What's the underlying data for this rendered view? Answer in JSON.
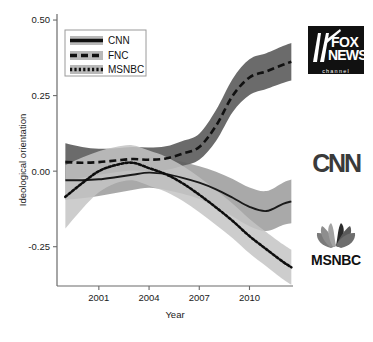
{
  "chart_data": {
    "type": "line",
    "title": "",
    "xlabel": "Year",
    "ylabel": "Ideological orientation",
    "xlim": [
      1998.5,
      2012.6
    ],
    "ylim": [
      -0.38,
      0.52
    ],
    "xticks": [
      2001,
      2004,
      2007,
      2010
    ],
    "xtick_labels": [
      "2001",
      "2004",
      "2007",
      "2010"
    ],
    "yticks": [
      0.5,
      0.25,
      0.0,
      -0.25
    ],
    "ytick_labels": [
      "0.50",
      "0.25",
      "0.00",
      "-0.25"
    ],
    "grid": false,
    "legend_position": "top-left",
    "band_type": "confidence interval",
    "series": [
      {
        "name": "CNN",
        "style": "solid",
        "color": "#1a1a1a",
        "band_color": "#9a9a9a",
        "x": [
          1999.0,
          2000.0,
          2001.0,
          2002.0,
          2003.0,
          2004.0,
          2005.0,
          2006.0,
          2007.0,
          2008.0,
          2009.0,
          2010.0,
          2011.0,
          2012.0,
          2012.5
        ],
        "values": [
          -0.03,
          -0.03,
          -0.027,
          -0.02,
          -0.012,
          -0.005,
          -0.01,
          -0.022,
          -0.038,
          -0.06,
          -0.088,
          -0.118,
          -0.132,
          -0.108,
          -0.1
        ],
        "band_lower": [
          -0.095,
          -0.09,
          -0.082,
          -0.072,
          -0.062,
          -0.055,
          -0.062,
          -0.075,
          -0.092,
          -0.118,
          -0.15,
          -0.182,
          -0.198,
          -0.178,
          -0.172
        ],
        "band_upper": [
          0.035,
          0.03,
          0.028,
          0.032,
          0.038,
          0.045,
          0.042,
          0.031,
          0.016,
          -0.002,
          -0.026,
          -0.054,
          -0.066,
          -0.038,
          -0.028
        ]
      },
      {
        "name": "FNC",
        "style": "dashed",
        "color": "#111111",
        "band_color": "#5e5e5e",
        "x": [
          1999.0,
          2000.0,
          2001.0,
          2002.0,
          2003.0,
          2004.0,
          2005.0,
          2006.0,
          2007.0,
          2008.0,
          2009.0,
          2010.0,
          2011.0,
          2012.0,
          2012.5
        ],
        "values": [
          0.03,
          0.028,
          0.03,
          0.035,
          0.04,
          0.038,
          0.042,
          0.058,
          0.08,
          0.15,
          0.25,
          0.31,
          0.33,
          0.352,
          0.362
        ],
        "band_lower": [
          -0.03,
          -0.022,
          -0.012,
          -0.004,
          0.002,
          0.0,
          0.004,
          0.018,
          0.038,
          0.1,
          0.196,
          0.252,
          0.272,
          0.292,
          0.3
        ],
        "band_upper": [
          0.092,
          0.08,
          0.074,
          0.076,
          0.08,
          0.078,
          0.082,
          0.1,
          0.124,
          0.202,
          0.306,
          0.37,
          0.39,
          0.414,
          0.424
        ]
      },
      {
        "name": "MSNBC",
        "style": "dotted",
        "color": "#0d0d0d",
        "band_color": "#c4c4c4",
        "x": [
          1999.0,
          2000.0,
          2001.0,
          2002.0,
          2003.0,
          2004.0,
          2005.0,
          2006.0,
          2007.0,
          2008.0,
          2009.0,
          2010.0,
          2011.0,
          2012.0,
          2012.5
        ],
        "values": [
          -0.085,
          -0.04,
          0.0,
          0.02,
          0.028,
          0.01,
          -0.01,
          -0.04,
          -0.078,
          -0.12,
          -0.165,
          -0.215,
          -0.258,
          -0.3,
          -0.318
        ],
        "band_lower": [
          -0.19,
          -0.125,
          -0.07,
          -0.04,
          -0.03,
          -0.048,
          -0.068,
          -0.098,
          -0.136,
          -0.178,
          -0.222,
          -0.272,
          -0.315,
          -0.358,
          -0.376
        ],
        "band_upper": [
          0.02,
          0.045,
          0.066,
          0.08,
          0.086,
          0.068,
          0.048,
          0.018,
          -0.02,
          -0.062,
          -0.108,
          -0.158,
          -0.201,
          -0.242,
          -0.26
        ]
      }
    ]
  },
  "legend": {
    "items": [
      {
        "label": "CNN",
        "style": "solid"
      },
      {
        "label": "FNC",
        "style": "dashed"
      },
      {
        "label": "MSNBC",
        "style": "dotted"
      }
    ]
  },
  "logos": [
    {
      "name": "fox-news-logo",
      "line1": "FOX",
      "line2": "NEWS",
      "line3": "channel"
    },
    {
      "name": "cnn-logo",
      "text": "CNN"
    },
    {
      "name": "msnbc-logo",
      "text": "MSNBC"
    }
  ]
}
